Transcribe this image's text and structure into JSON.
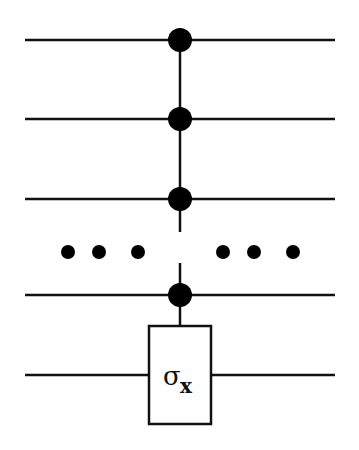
{
  "diagram": {
    "type": "quantum-circuit",
    "gate": {
      "symbol": "σ",
      "subscript": "x"
    },
    "wires": [
      {
        "role": "control",
        "y": 40
      },
      {
        "role": "control",
        "y": 119
      },
      {
        "role": "control",
        "y": 199
      },
      {
        "role": "control",
        "y": 295
      },
      {
        "role": "target",
        "y": 375
      }
    ],
    "ellipsis": "• • •   • • •",
    "colors": {
      "line": "#111111",
      "background": "#ffffff"
    }
  }
}
